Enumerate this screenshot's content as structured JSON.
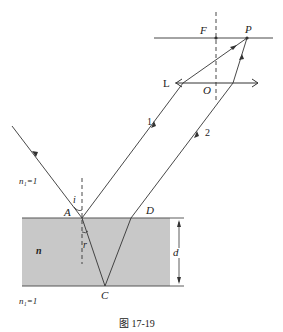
{
  "diagram": {
    "caption": "图 17-19",
    "points": {
      "A": "A",
      "C": "C",
      "D": "D",
      "F": "F",
      "P": "P",
      "O": "O",
      "L": "L"
    },
    "rays": {
      "ray1": "1",
      "ray2": "2"
    },
    "angles": {
      "incidence": "i",
      "refraction": "r"
    },
    "media": {
      "outer_top": "n₁=1",
      "slab": "n",
      "outer_bottom": "n₁=1"
    },
    "thickness": "d",
    "colors": {
      "slab_fill": "#c8c8c8",
      "line": "#333333"
    }
  }
}
